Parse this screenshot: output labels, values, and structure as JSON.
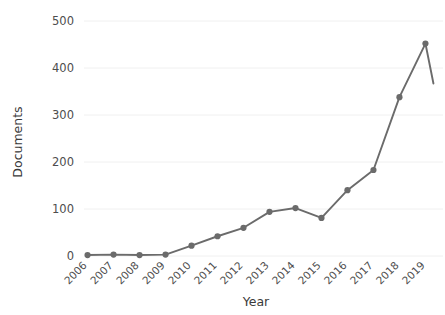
{
  "chart_data": {
    "type": "line",
    "title": "",
    "xlabel": "Year",
    "ylabel": "Documents",
    "categories": [
      "2006",
      "2007",
      "2008",
      "2009",
      "2010",
      "2011",
      "2012",
      "2013",
      "2014",
      "2015",
      "2016",
      "2017",
      "2018",
      "2019"
    ],
    "values": [
      2,
      3,
      2,
      3,
      22,
      42,
      60,
      94,
      102,
      81,
      140,
      183,
      338,
      452
    ],
    "series": [
      {
        "name": "Documents",
        "values": [
          2,
          3,
          2,
          3,
          22,
          42,
          60,
          94,
          102,
          81,
          140,
          183,
          338,
          452
        ]
      }
    ],
    "ylim": [
      0,
      500
    ],
    "yticks": [
      0,
      100,
      200,
      300,
      400,
      500
    ],
    "ytick_labels": [
      "0",
      "100",
      "200",
      "300",
      "400",
      "500"
    ],
    "grid": true,
    "grid_axis": "y",
    "legend": false,
    "legend_position": "none",
    "markers": true,
    "line_color": "#6b6b6b",
    "marker_color": "#6b6b6b",
    "grid_color": "#f0f0f0",
    "text_color": "#4d4d4d",
    "background_color": "#ffffff",
    "xtick_rotation": 45,
    "annotations": []
  },
  "axes": {
    "y_title": "Documents",
    "x_title": "Year"
  }
}
